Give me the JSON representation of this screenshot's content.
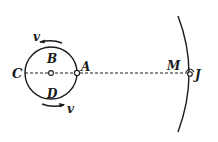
{
  "diagram": {
    "type": "orbit-schematic",
    "colors": {
      "ink": "#1a1a1a",
      "background": "#ffffff"
    },
    "labels": {
      "C": "C",
      "B": "B",
      "A": "A",
      "D": "D",
      "M": "M",
      "J": "J",
      "v_top": "v",
      "v_bottom": "v"
    },
    "elements": {
      "small_orbit": "circle centered between C and A",
      "center_point": "hollow dot at circle center",
      "point_A": "hollow dot at right edge of circle",
      "line_CJ": "dashed line from C through A to J",
      "big_orbit": "large arc passing through J",
      "point_J": "hollow dot on large arc with small arc mark",
      "velocity_top": "arrow pointing left above B",
      "velocity_bottom": "arrow pointing right below D"
    }
  }
}
